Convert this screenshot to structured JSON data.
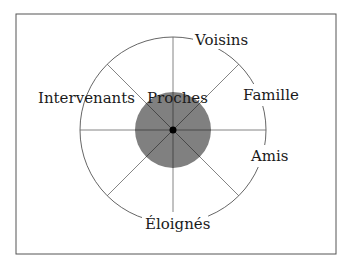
{
  "diagram": {
    "type": "radial-social-network",
    "center_label": "Proches",
    "labels": {
      "top_right": "Voisins",
      "right_upper": "Famille",
      "right_lower": "Amis",
      "bottom": "Éloignés",
      "left": "Intervenants",
      "center": "Proches"
    },
    "colors": {
      "frame": "#555555",
      "outer_circle": "#555555",
      "spokes": "#555555",
      "inner_disc": "#808080",
      "center_dot": "#000000",
      "text": "#1a1a1a"
    },
    "spokes": 8
  }
}
